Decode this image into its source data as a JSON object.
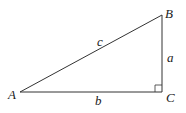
{
  "diagram": {
    "type": "right-triangle",
    "vertices": {
      "A": {
        "label": "A",
        "x": 20,
        "y": 92
      },
      "B": {
        "label": "B",
        "x": 162,
        "y": 15
      },
      "C": {
        "label": "C",
        "x": 162,
        "y": 92
      }
    },
    "sides": {
      "a": {
        "label": "a",
        "between": [
          "B",
          "C"
        ]
      },
      "b": {
        "label": "b",
        "between": [
          "A",
          "C"
        ]
      },
      "c": {
        "label": "c",
        "between": [
          "A",
          "B"
        ]
      }
    },
    "right_angle_at": "C",
    "stroke_color": "#333333"
  }
}
